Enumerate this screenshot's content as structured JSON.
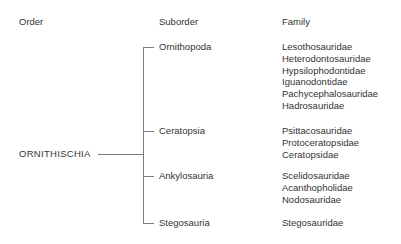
{
  "headers": {
    "order": "Order",
    "suborder": "Suborder",
    "family": "Family"
  },
  "order": "ORNITHISCHIA",
  "suborders": [
    {
      "name": "Ornithopoda",
      "families": [
        "Lesothosauridae",
        "Heterodontosauridae",
        "Hypsilophodontidae",
        "Iguanodontidae",
        "Pachycephalosauridae",
        "Hadrosauridae"
      ]
    },
    {
      "name": "Ceratopsia",
      "families": [
        "Psittacosauridae",
        "Protoceratopsidae",
        "Ceratopsidae"
      ]
    },
    {
      "name": "Ankylosauria",
      "families": [
        "Scelidosauridae",
        "Acanthopholidae",
        "Nodosauridae"
      ]
    },
    {
      "name": "Stegosauria",
      "families": [
        "Stegosauridae"
      ]
    }
  ]
}
